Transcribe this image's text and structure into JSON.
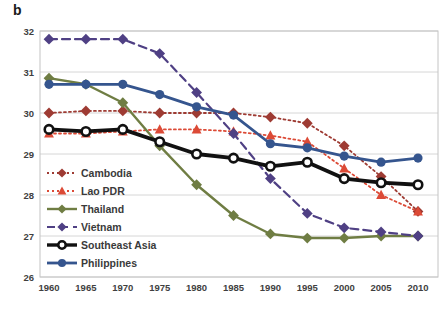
{
  "figure": {
    "label": "b"
  },
  "chart_data": {
    "type": "line",
    "title": "",
    "xlabel": "",
    "ylabel": "",
    "categories": [
      "1960",
      "1965",
      "1970",
      "1975",
      "1980",
      "1985",
      "1990",
      "1995",
      "2000",
      "2005",
      "2010"
    ],
    "ylim": [
      26,
      32
    ],
    "yticks": [
      "26",
      "27",
      "28",
      "29",
      "30",
      "31",
      "32"
    ],
    "grid": "horizontal",
    "legend_position": "inside-left",
    "series": [
      {
        "name": "Cambodia",
        "color": "#9E3B33",
        "line": "dotted",
        "marker": "diamond",
        "width": 1.8,
        "values": [
          30.0,
          30.05,
          30.05,
          30.0,
          30.0,
          30.0,
          29.9,
          29.75,
          29.2,
          28.45,
          27.6
        ]
      },
      {
        "name": "Lao PDR",
        "color": "#DC4A36",
        "line": "dotted",
        "marker": "triangle",
        "width": 1.8,
        "values": [
          29.5,
          29.5,
          29.55,
          29.6,
          29.6,
          29.55,
          29.45,
          29.3,
          28.65,
          28.0,
          27.6
        ]
      },
      {
        "name": "Thailand",
        "color": "#6F7D43",
        "line": "solid",
        "marker": "diamond",
        "width": 2.4,
        "values": [
          30.85,
          30.7,
          30.25,
          29.2,
          28.25,
          27.5,
          27.05,
          26.95,
          26.95,
          27.0,
          27.0
        ]
      },
      {
        "name": "Vietnam",
        "color": "#4F4084",
        "line": "dashed",
        "marker": "diamond",
        "width": 2.2,
        "values": [
          31.8,
          31.8,
          31.8,
          31.45,
          30.5,
          29.5,
          28.4,
          27.55,
          27.2,
          27.1,
          27.0
        ]
      },
      {
        "name": "Southeast Asia",
        "color": "#111111",
        "line": "solid",
        "marker": "open-circle",
        "width": 3.8,
        "values": [
          29.6,
          29.55,
          29.6,
          29.3,
          29.0,
          28.9,
          28.7,
          28.8,
          28.4,
          28.3,
          28.25
        ]
      },
      {
        "name": "Philippines",
        "color": "#35558E",
        "line": "solid",
        "marker": "circle",
        "width": 2.8,
        "values": [
          30.7,
          30.7,
          30.7,
          30.45,
          30.15,
          29.95,
          29.25,
          29.15,
          28.95,
          28.8,
          28.9
        ]
      }
    ]
  }
}
